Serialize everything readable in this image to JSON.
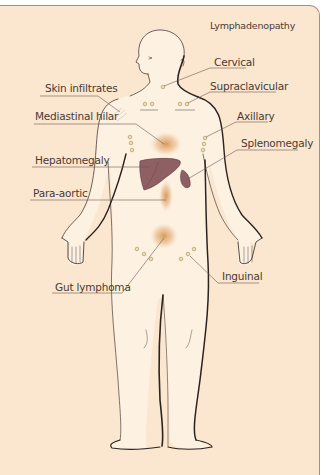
{
  "title": "Lymphadenopathy",
  "colors": {
    "panel_background": "#fbe6cf",
    "panel_border": "#b9877a",
    "body_fill": "#fdf1e2",
    "outline": "#2b2320",
    "organ_fill": "#8e5f63",
    "node_fill": "#f1e2a8",
    "node_stroke": "#a08c5a",
    "mass_glow": "#d9904a",
    "text": "#4a3a33",
    "leader_line": "#6b5a52"
  },
  "labels": {
    "cervical": "Cervical",
    "skin_infiltrates": "Skin infiltrates",
    "supraclavicular": "Supraclavicular",
    "mediastinal_hilar": "Mediastinal hilar",
    "axillary": "Axillary",
    "splenomegaly": "Splenomegaly",
    "hepatomegaly": "Hepatomegaly",
    "para_aortic": "Para-aortic",
    "inguinal": "Inguinal",
    "gut_lymphoma": "Gut lymphoma"
  },
  "sites_left": [
    "Skin infiltrates",
    "Mediastinal hilar",
    "Hepatomegaly",
    "Para-aortic",
    "Gut lymphoma"
  ],
  "sites_right": [
    "Cervical",
    "Supraclavicular",
    "Axillary",
    "Splenomegaly",
    "Inguinal"
  ]
}
